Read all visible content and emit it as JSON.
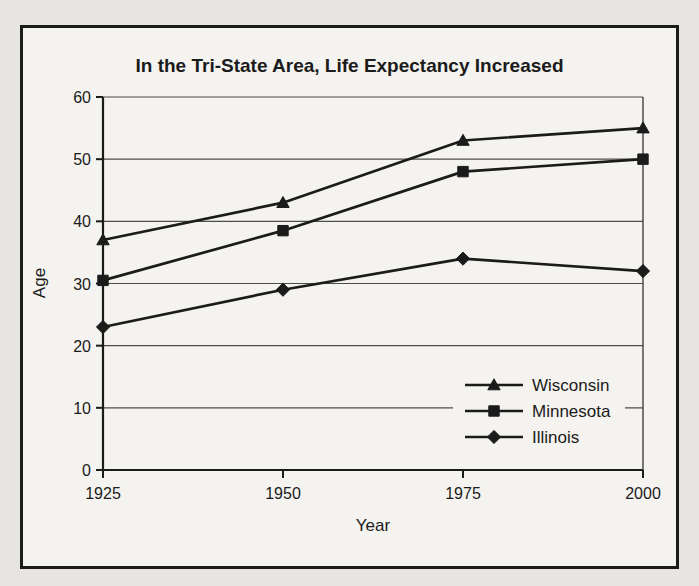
{
  "chart_data": {
    "type": "line",
    "title": "In the Tri-State Area, Life Expectancy Increased",
    "xlabel": "Year",
    "ylabel": "Age",
    "x_categories": [
      "1925",
      "1950",
      "1975",
      "2000"
    ],
    "series": [
      {
        "name": "Wisconsin",
        "marker": "triangle",
        "values": [
          37,
          43,
          53,
          55
        ]
      },
      {
        "name": "Minnesota",
        "marker": "square",
        "values": [
          30.5,
          38.5,
          48,
          50
        ]
      },
      {
        "name": "Illinois",
        "marker": "diamond",
        "values": [
          23,
          29,
          34,
          32
        ]
      }
    ],
    "ylim": [
      0,
      60
    ],
    "yticks": [
      0,
      10,
      20,
      30,
      40,
      50,
      60
    ],
    "grid": true,
    "legend": {
      "position": "inside-lower-right",
      "entries": [
        "Wisconsin",
        "Minnesota",
        "Illinois"
      ]
    }
  },
  "colors": {
    "ink": "#1b1b1b",
    "gridline": "#4c4c4c",
    "page_background": "#e7e5e1",
    "figure_background": "#f5f3ef"
  }
}
